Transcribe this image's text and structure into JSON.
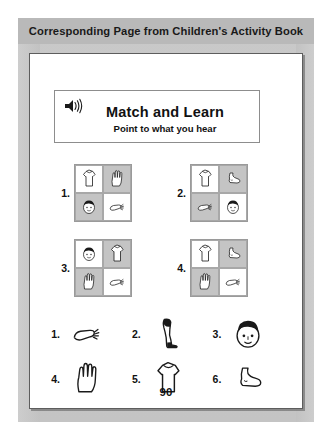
{
  "banner": {
    "title": "Corresponding Page from Children's Activity Book"
  },
  "title_card": {
    "icon": "speaker-icon",
    "heading": "Match and Learn",
    "subheading": "Point to what you hear"
  },
  "match_items": [
    {
      "number": "1.",
      "cells": [
        {
          "pic": "shirt",
          "bg": "white"
        },
        {
          "pic": "hand",
          "bg": "gray"
        },
        {
          "pic": "face",
          "bg": "gray"
        },
        {
          "pic": "arm",
          "bg": "white"
        }
      ]
    },
    {
      "number": "2.",
      "cells": [
        {
          "pic": "shirt",
          "bg": "white"
        },
        {
          "pic": "foot",
          "bg": "gray"
        },
        {
          "pic": "arm",
          "bg": "gray"
        },
        {
          "pic": "face",
          "bg": "white"
        }
      ]
    },
    {
      "number": "3.",
      "cells": [
        {
          "pic": "face",
          "bg": "white"
        },
        {
          "pic": "shirt",
          "bg": "gray"
        },
        {
          "pic": "hand",
          "bg": "gray"
        },
        {
          "pic": "arm",
          "bg": "white"
        }
      ]
    },
    {
      "number": "4.",
      "cells": [
        {
          "pic": "shirt",
          "bg": "white"
        },
        {
          "pic": "foot",
          "bg": "gray"
        },
        {
          "pic": "hand",
          "bg": "gray"
        },
        {
          "pic": "arm",
          "bg": "white"
        }
      ]
    }
  ],
  "answer_bank": [
    {
      "number": "1.",
      "pic": "arm"
    },
    {
      "number": "2.",
      "pic": "leg"
    },
    {
      "number": "3.",
      "pic": "head"
    },
    {
      "number": "4.",
      "pic": "hand"
    },
    {
      "number": "5.",
      "pic": "shirt"
    },
    {
      "number": "6.",
      "pic": "foot"
    }
  ],
  "footer": {
    "page_number": "90"
  },
  "colors": {
    "banner_bg": "#b9b9b9",
    "sheet_bg": "#c6c6c6",
    "page_bg": "#ffffff",
    "cell_gray": "#c4c4c4",
    "ink": "#111111"
  }
}
